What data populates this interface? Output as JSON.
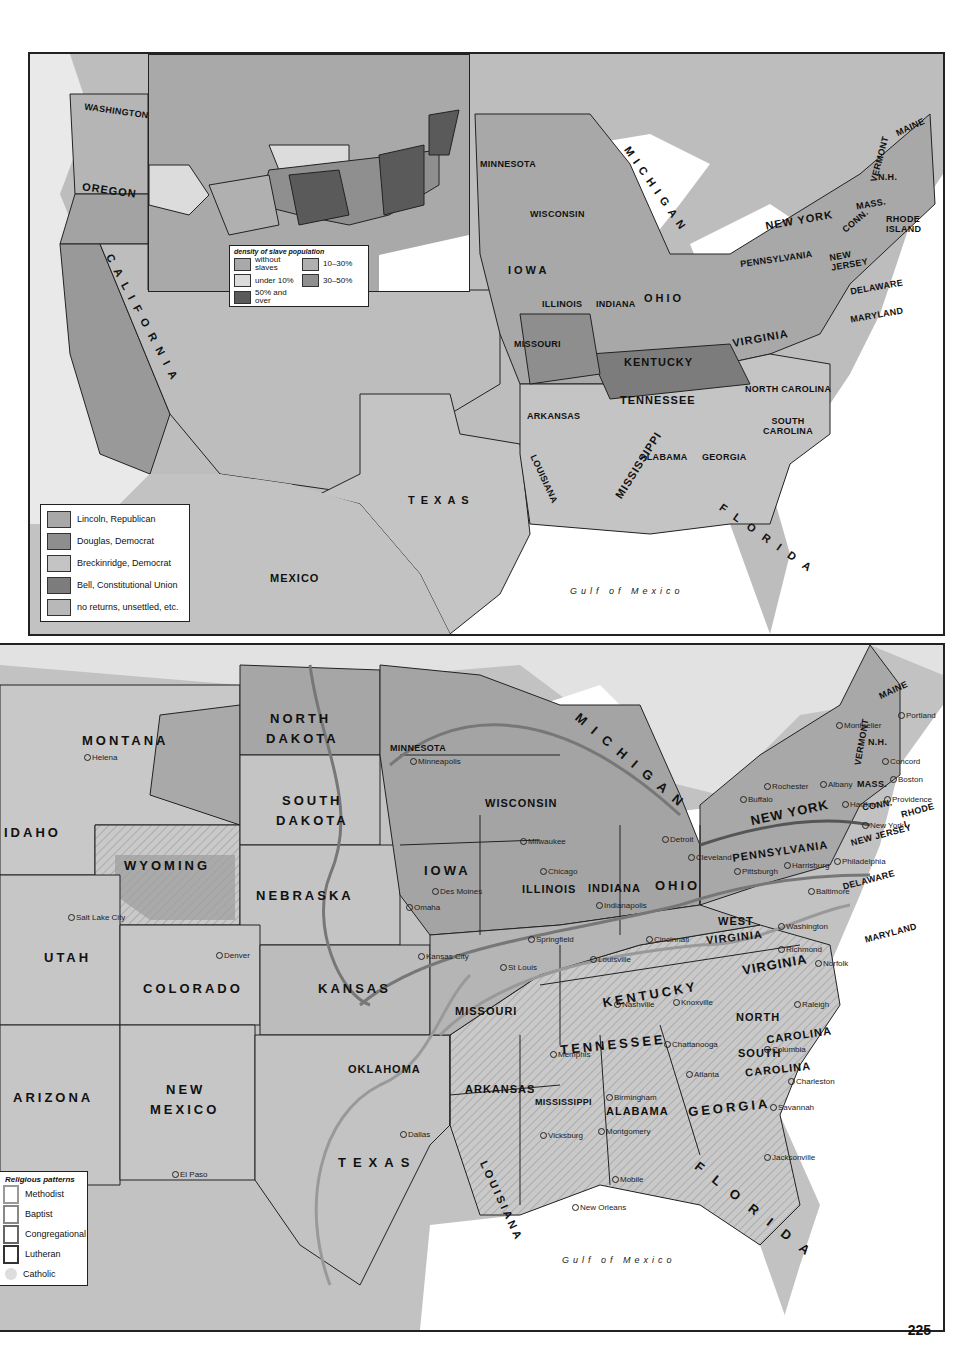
{
  "page": {
    "number": "225"
  },
  "top_map": {
    "title_hint": "Election of 1860",
    "legend": {
      "items": [
        {
          "label": "Lincoln, Republican",
          "color": "#a8a8a8"
        },
        {
          "label": "Douglas, Democrat",
          "color": "#8e8e8e"
        },
        {
          "label": "Breckinridge, Democrat",
          "color": "#c4c4c4"
        },
        {
          "label": "Bell, Constitutional Union",
          "color": "#7c7c7c"
        },
        {
          "label": "no returns, unsettled, etc.",
          "color": "#b8b8b8"
        }
      ]
    },
    "inset_legend": {
      "title": "density of slave population",
      "items": [
        {
          "label": "without slaves",
          "color": "#a9a9a9"
        },
        {
          "label": "under 10%",
          "color": "#dcdcdc"
        },
        {
          "label": "10–30%",
          "color": "#b0b0b0"
        },
        {
          "label": "30–50%",
          "color": "#8f8f8f"
        },
        {
          "label": "50% and over",
          "color": "#5a5a5a"
        }
      ]
    },
    "states": {
      "washington": "WASHINGTON",
      "oregon": "OREGON",
      "california": "CALIFORNIA",
      "minnesota": "MINNESOTA",
      "wisconsin": "WISCONSIN",
      "michigan": "MICHIGAN",
      "iowa": "IOWA",
      "illinois": "ILLINOIS",
      "indiana": "INDIANA",
      "ohio": "OHIO",
      "missouri": "MISSOURI",
      "kentucky": "KENTUCKY",
      "tennessee": "TENNESSEE",
      "arkansas": "ARKANSAS",
      "mississippi": "MISSISSIPPI",
      "alabama": "ALABAMA",
      "georgia": "GEORGIA",
      "louisiana": "LOUISIANA",
      "florida": "FLORIDA",
      "texas": "TEXAS",
      "south_carolina": "SOUTH CAROLINA",
      "north_carolina": "NORTH CAROLINA",
      "virginia": "VIRGINIA",
      "maryland": "MARYLAND",
      "delaware": "DELAWARE",
      "new_jersey": "NEW JERSEY",
      "pennsylvania": "PENNSYLVANIA",
      "new_york": "NEW YORK",
      "vermont": "VERMONT",
      "nh": "N.H.",
      "maine": "MAINE",
      "mass": "MASS.",
      "conn": "CONN.",
      "rhode_island": "RHODE ISLAND"
    },
    "other": {
      "mexico": "MEXICO",
      "gulf": "Gulf of Mexico"
    }
  },
  "bottom_map": {
    "title_hint": "Religious patterns",
    "legend": {
      "title": "Religious patterns",
      "items": [
        {
          "label": "Methodist"
        },
        {
          "label": "Baptist"
        },
        {
          "label": "Congregational"
        },
        {
          "label": "Lutheran"
        },
        {
          "label": "Catholic"
        }
      ]
    },
    "states": {
      "montana": "MONTANA",
      "north_dakota_1": "NORTH",
      "north_dakota_2": "DAKOTA",
      "south_dakota_1": "SOUTH",
      "south_dakota_2": "DAKOTA",
      "minnesota": "MINNESOTA",
      "wisconsin": "WISCONSIN",
      "michigan": "MICHIGAN",
      "idaho": "IDAHO",
      "wyoming": "WYOMING",
      "nebraska": "NEBRASKA",
      "iowa": "IOWA",
      "illinois": "ILLINOIS",
      "indiana": "INDIANA",
      "ohio": "OHIO",
      "utah": "UTAH",
      "colorado": "COLORADO",
      "kansas": "KANSAS",
      "missouri": "MISSOURI",
      "kentucky": "KENTUCKY",
      "west_virginia_1": "WEST",
      "west_virginia_2": "VIRGINIA",
      "virginia": "VIRGINIA",
      "north_carolina_1": "NORTH",
      "north_carolina_2": "CAROLINA",
      "tennessee": "TENNESSEE",
      "south_carolina_1": "SOUTH",
      "south_carolina_2": "CAROLINA",
      "arizona": "ARIZONA",
      "new_mexico_1": "NEW",
      "new_mexico_2": "MEXICO",
      "oklahoma": "OKLAHOMA",
      "arkansas": "ARKANSAS",
      "mississippi": "MISSISSIPPI",
      "alabama": "ALABAMA",
      "georgia": "GEORGIA",
      "texas": "TEXAS",
      "louisiana": "LOUISIANA",
      "florida": "FLORIDA",
      "pennsylvania": "PENNSYLVANIA",
      "new_york": "NEW YORK",
      "new_jersey": "NEW JERSEY",
      "delaware": "DELAWARE",
      "maryland": "MARYLAND",
      "maine": "MAINE",
      "vermont": "VERMONT",
      "nh": "N.H.",
      "mass": "MASS.",
      "conn": "CONN.",
      "rhode": "RHODE I."
    },
    "cities": {
      "helena": "Helena",
      "salt_lake_city": "Salt Lake City",
      "denver": "Denver",
      "el_paso": "El Paso",
      "dallas": "Dallas",
      "minneapolis": "Minneapolis",
      "milwaukee": "Milwaukee",
      "chicago": "Chicago",
      "detroit": "Detroit",
      "des_moines": "Des Moines",
      "omaha": "Omaha",
      "springfield": "Springfield",
      "indianapolis": "Indianapolis",
      "cincinnati": "Cincinnati",
      "cleveland": "Cleveland",
      "kansas_city": "Kansas City",
      "st_louis": "St Louis",
      "louisville": "Louisville",
      "nashville": "Nashville",
      "knoxville": "Knoxville",
      "memphis": "Memphis",
      "chattanooga": "Chattanooga",
      "atlanta": "Atlanta",
      "birmingham": "Birmingham",
      "montgomery": "Montgomery",
      "vicksburg": "Vicksburg",
      "mobile": "Mobile",
      "new_orleans": "New Orleans",
      "jacksonville": "Jacksonville",
      "savannah": "Savannah",
      "charleston": "Charleston",
      "columbia": "Columbia",
      "raleigh": "Raleigh",
      "richmond": "Richmond",
      "norfolk": "Norfolk",
      "washington": "Washington",
      "baltimore": "Baltimore",
      "philadelphia": "Philadelphia",
      "pittsburgh": "Pittsburgh",
      "harrisburg": "Harrisburg",
      "new_york": "New York",
      "buffalo": "Buffalo",
      "rochester": "Rochester",
      "albany": "Albany",
      "hartford": "Hartford",
      "providence": "Providence",
      "boston": "Boston",
      "concord": "Concord",
      "montpelier": "Montpelier",
      "portland": "Portland"
    },
    "other": {
      "gulf": "Gulf of Mexico"
    }
  }
}
